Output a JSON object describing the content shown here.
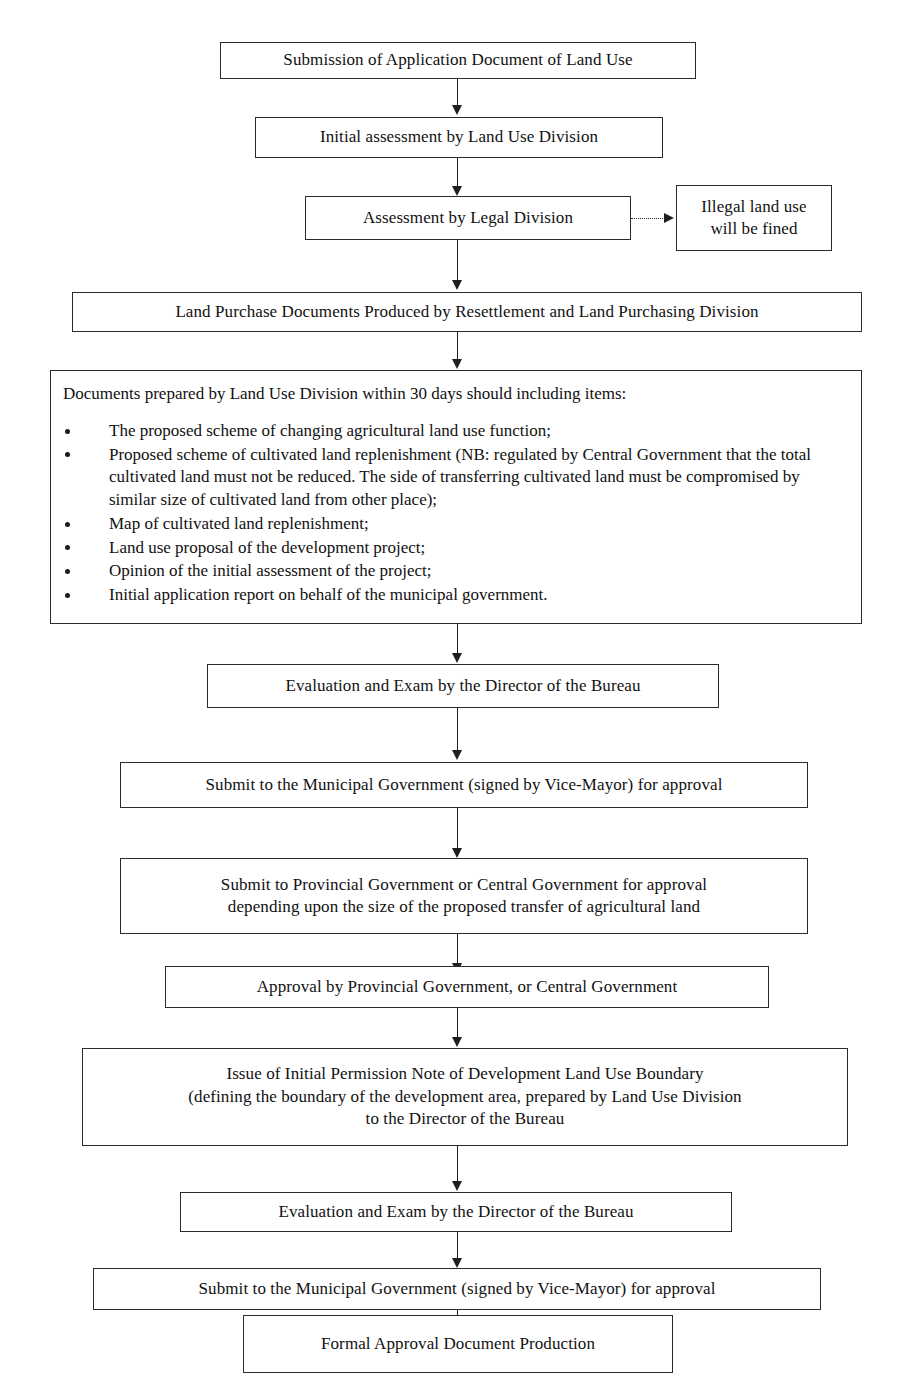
{
  "diagram": {
    "nodes": [
      {
        "id": "submission",
        "label": "Submission of Application Document of Land Use"
      },
      {
        "id": "initial-assessment",
        "label": "Initial assessment by Land Use Division"
      },
      {
        "id": "legal-assessment",
        "label": "Assessment by Legal Division"
      },
      {
        "id": "illegal-fined",
        "label": "Illegal land use\nwill be fined"
      },
      {
        "id": "land-purchase",
        "label": "Land Purchase Documents Produced by Resettlement and Land Purchasing Division"
      },
      {
        "id": "evaluation-exam-1",
        "label": "Evaluation and Exam by the Director of the Bureau"
      },
      {
        "id": "submit-municipal-1",
        "label": "Submit to the Municipal Government (signed by Vice-Mayor) for approval"
      },
      {
        "id": "submit-provincial",
        "label": "Submit to Provincial Government or Central Government for approval\ndepending upon the size of the proposed transfer of agricultural land"
      },
      {
        "id": "approval-provincial",
        "label": "Approval by Provincial Government, or Central Government"
      },
      {
        "id": "permission-note",
        "label": "Issue of Initial Permission Note of Development Land Use Boundary\n(defining the boundary of the development area, prepared by Land Use Division\nto the Director of the Bureau"
      },
      {
        "id": "evaluation-exam-2",
        "label": "Evaluation and Exam by the Director of the Bureau"
      },
      {
        "id": "submit-municipal-2",
        "label": "Submit to the Municipal Government (signed by Vice-Mayor) for approval"
      },
      {
        "id": "formal-approval",
        "label": "Formal Approval Document Production"
      }
    ],
    "documents_box": {
      "heading": "Documents prepared by Land Use Division within 30 days should including items:",
      "items": [
        "The proposed scheme of changing agricultural land use function;",
        "Proposed scheme of cultivated land replenishment (NB: regulated by Central Government that the total cultivated land must not be reduced. The side of transferring cultivated land must be compromised by similar size of cultivated land from other place);",
        "Map of cultivated land replenishment;",
        "Land use proposal of the development project;",
        "Opinion of the initial assessment of the project;",
        "Initial application report on behalf of the municipal government."
      ]
    }
  }
}
